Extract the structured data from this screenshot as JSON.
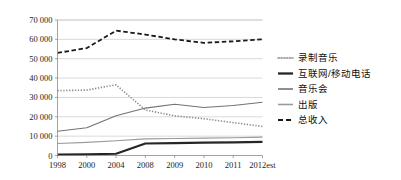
{
  "chart_data": {
    "type": "line",
    "title": "",
    "subtitle": "",
    "xlabel": "",
    "ylabel": "",
    "categories": [
      "1998",
      "2000",
      "2004",
      "2008",
      "2009",
      "2010",
      "2011",
      "2012est"
    ],
    "ylim": [
      0,
      70000
    ],
    "ytick_values": [
      0,
      10000,
      20000,
      30000,
      40000,
      50000,
      60000,
      70000
    ],
    "ytick_labels": [
      "0",
      "10 000",
      "20 000",
      "30 000",
      "40 000",
      "50 000",
      "60 000",
      "70 000"
    ],
    "grid": true,
    "legend_position": "right",
    "series": [
      {
        "name": "录制音乐",
        "style": "dotted",
        "color": "#8c8c8c",
        "width": 1.6,
        "values": [
          33500,
          33800,
          36500,
          23500,
          20500,
          19000,
          17000,
          15000
        ]
      },
      {
        "name": "互联网/移动电话",
        "style": "solid",
        "color": "#262626",
        "width": 2.2,
        "values": [
          500,
          600,
          900,
          6200,
          6400,
          6600,
          6800,
          7000
        ]
      },
      {
        "name": "音乐会",
        "style": "solid",
        "color": "#737373",
        "width": 1.1,
        "values": [
          12500,
          14300,
          20500,
          24500,
          26500,
          24800,
          25800,
          27500
        ]
      },
      {
        "name": "出版",
        "style": "solid",
        "color": "#9a9a9a",
        "width": 1.1,
        "values": [
          6200,
          6800,
          7600,
          8600,
          8800,
          9000,
          9200,
          9500
        ]
      },
      {
        "name": "总收入",
        "style": "dashed",
        "color": "#1a1a1a",
        "width": 1.8,
        "values": [
          53000,
          55500,
          64500,
          62500,
          60000,
          58200,
          59000,
          60000
        ]
      }
    ]
  },
  "axes": {
    "y_ticks": [
      {
        "label": "70 000",
        "value": 70000
      },
      {
        "label": "60 000",
        "value": 60000
      },
      {
        "label": "50 000",
        "value": 50000
      },
      {
        "label": "40 000",
        "value": 40000
      },
      {
        "label": "30 000",
        "value": 30000
      },
      {
        "label": "20 000",
        "value": 20000
      },
      {
        "label": "10 000",
        "value": 10000
      },
      {
        "label": "0",
        "value": 0
      }
    ],
    "x_ticks": [
      {
        "label": "1998"
      },
      {
        "label": "2000"
      },
      {
        "label": "2004"
      },
      {
        "label": "2008"
      },
      {
        "label": "2009"
      },
      {
        "label": "2010"
      },
      {
        "label": "2011"
      },
      {
        "label": "2012est"
      }
    ]
  },
  "legend": {
    "items": [
      {
        "label": "录制音乐",
        "style": "dotted",
        "color": "#8c8c8c"
      },
      {
        "label": "互联网/移动电话",
        "style": "solid-thick",
        "color": "#262626"
      },
      {
        "label": "音乐会",
        "style": "solid",
        "color": "#737373"
      },
      {
        "label": "出版",
        "style": "solid",
        "color": "#9a9a9a"
      },
      {
        "label": "总收入",
        "style": "dashed",
        "color": "#1a1a1a"
      }
    ]
  }
}
